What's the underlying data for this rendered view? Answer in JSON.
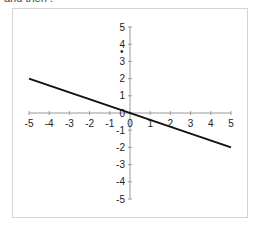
{
  "header": {
    "cut_text": "and then ."
  },
  "chart_data": {
    "type": "line",
    "title": "",
    "xlabel": "",
    "ylabel": "",
    "xlim": [
      -5,
      5
    ],
    "ylim": [
      -5,
      5
    ],
    "grid": false,
    "legend": null,
    "x_ticks": [
      -5,
      -4,
      -3,
      -2,
      -1,
      0,
      1,
      2,
      3,
      4,
      5
    ],
    "y_ticks": [
      -5,
      -4,
      -3,
      -2,
      -1,
      0,
      1,
      2,
      3,
      4,
      5
    ],
    "series": [
      {
        "name": "line",
        "x": [
          -5,
          5
        ],
        "y": [
          2,
          -2
        ],
        "color": "#111111"
      }
    ],
    "annotations": [
      {
        "text": "•",
        "x": -0.2,
        "y": 3.6
      }
    ]
  }
}
